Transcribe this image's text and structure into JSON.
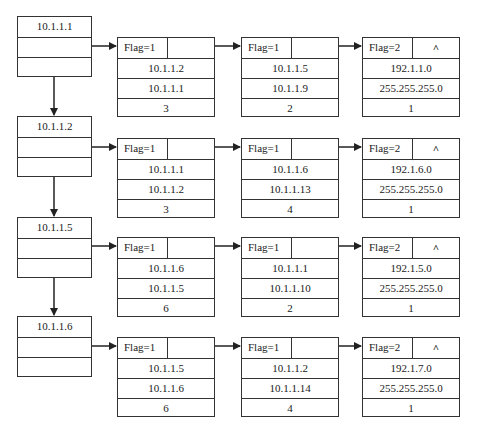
{
  "diagram": {
    "type": "adjacency-list",
    "rows": [
      {
        "head": {
          "label": "10.1.1.1"
        },
        "nodes": [
          {
            "flag": "Flag=1",
            "pointer": "",
            "fields": [
              "10.1.1.2",
              "10.1.1.1",
              "3"
            ]
          },
          {
            "flag": "Flag=1",
            "pointer": "",
            "fields": [
              "10.1.1.5",
              "10.1.1.9",
              "2"
            ]
          },
          {
            "flag": "Flag=2",
            "pointer": "^",
            "fields": [
              "192.1.1.0",
              "255.255.255.0",
              "1"
            ]
          }
        ]
      },
      {
        "head": {
          "label": "10.1.1.2"
        },
        "nodes": [
          {
            "flag": "Flag=1",
            "pointer": "",
            "fields": [
              "10.1.1.1",
              "10.1.1.2",
              "3"
            ]
          },
          {
            "flag": "Flag=1",
            "pointer": "",
            "fields": [
              "10.1.1.6",
              "10.1.1.13",
              "4"
            ]
          },
          {
            "flag": "Flag=2",
            "pointer": "^",
            "fields": [
              "192.1.6.0",
              "255.255.255.0",
              "1"
            ]
          }
        ]
      },
      {
        "head": {
          "label": "10.1.1.5"
        },
        "nodes": [
          {
            "flag": "Flag=1",
            "pointer": "",
            "fields": [
              "10.1.1.6",
              "10.1.1.5",
              "6"
            ]
          },
          {
            "flag": "Flag=1",
            "pointer": "",
            "fields": [
              "10.1.1.1",
              "10.1.1.10",
              "2"
            ]
          },
          {
            "flag": "Flag=2",
            "pointer": "^",
            "fields": [
              "192.1.5.0",
              "255.255.255.0",
              "1"
            ]
          }
        ]
      },
      {
        "head": {
          "label": "10.1.1.6"
        },
        "nodes": [
          {
            "flag": "Flag=1",
            "pointer": "",
            "fields": [
              "10.1.1.5",
              "10.1.1.6",
              "6"
            ]
          },
          {
            "flag": "Flag=1",
            "pointer": "",
            "fields": [
              "10.1.1.2",
              "10.1.1.14",
              "4"
            ]
          },
          {
            "flag": "Flag=2",
            "pointer": "^",
            "fields": [
              "192.1.7.0",
              "255.255.255.0",
              "1"
            ]
          }
        ]
      }
    ],
    "colors": {
      "line": "#333333",
      "background": "#ffffff",
      "text": "#1a1a1a"
    }
  }
}
